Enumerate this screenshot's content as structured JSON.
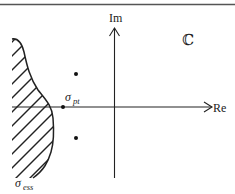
{
  "diagram": {
    "plane_label": "ℂ",
    "axes": {
      "x_label": "Re",
      "y_label": "Im"
    },
    "labels": {
      "sigma_pt": {
        "base": "σ",
        "sub": "pt"
      },
      "sigma_ess": {
        "base": "σ",
        "sub": "ess"
      }
    },
    "regions": [
      {
        "name": "essential-spectrum",
        "style": "hatched",
        "label": "σ_ess"
      }
    ],
    "points": [
      {
        "name": "eigenvalue-upper",
        "x": 76,
        "y": 74
      },
      {
        "name": "eigenvalue-real",
        "x": 63,
        "y": 107
      },
      {
        "name": "eigenvalue-lower",
        "x": 76,
        "y": 138
      }
    ],
    "colors": {
      "stroke": "#222222",
      "rule": "#555555",
      "background": "#ffffff"
    }
  }
}
